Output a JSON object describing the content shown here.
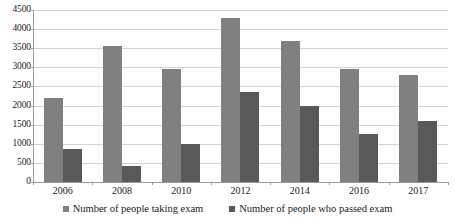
{
  "chart_data": {
    "type": "bar",
    "title": "",
    "xlabel": "",
    "ylabel": "",
    "categories": [
      "2006",
      "2008",
      "2010",
      "2012",
      "2014",
      "2016",
      "2017"
    ],
    "series": [
      {
        "name": "Number of people taking exam",
        "color": "#808080",
        "values": [
          2190,
          3550,
          2950,
          4280,
          3680,
          2960,
          2810
        ]
      },
      {
        "name": "Number of people who passed exam",
        "color": "#595959",
        "values": [
          860,
          420,
          990,
          2350,
          1980,
          1260,
          1600
        ]
      }
    ],
    "ylim": [
      0,
      4500
    ],
    "ytick_labels": [
      "0",
      "500",
      "1000",
      "1500",
      "2000",
      "2500",
      "3000",
      "3500",
      "4000",
      "4500"
    ],
    "ytick_values": [
      0,
      500,
      1000,
      1500,
      2000,
      2500,
      3000,
      3500,
      4000,
      4500
    ],
    "grid": true,
    "grid_axis": "y",
    "legend_position": "bottom",
    "background_color": "#ffffff",
    "gridline_color": "#d4d4d4",
    "axis_color": "#9a9a9a"
  },
  "legend": {
    "items": [
      {
        "label": "Number of people taking exam",
        "swatch": "legend-swatch-taking"
      },
      {
        "label": "Number of people who passed exam",
        "swatch": "legend-swatch-passed"
      }
    ]
  }
}
